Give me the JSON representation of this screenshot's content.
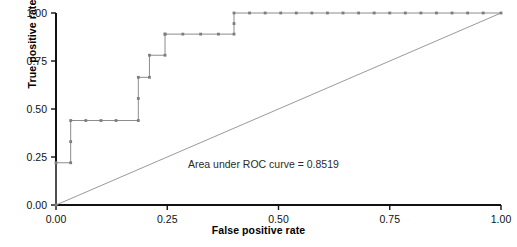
{
  "chart_data": {
    "type": "line",
    "title": "",
    "xlabel": "False positive rate",
    "ylabel": "True positive rate",
    "xlim": [
      0.0,
      1.0
    ],
    "ylim": [
      0.0,
      1.0
    ],
    "xticks": [
      "0.00",
      "0.25",
      "0.50",
      "0.75",
      "1.00"
    ],
    "yticks": [
      "0.00",
      "0.25",
      "0.50",
      "0.75",
      "1.00"
    ],
    "xtick_values": [
      0.0,
      0.25,
      0.5,
      0.75,
      1.0
    ],
    "ytick_values": [
      0.0,
      0.25,
      0.5,
      0.75,
      1.0
    ],
    "grid": false,
    "legend": "none",
    "annotation": "Area under ROC curve = 0.8519",
    "auc": 0.8519,
    "series": [
      {
        "name": "ROC curve",
        "style": "step",
        "color": "#8c8c8c",
        "marker": "dot",
        "x": [
          0.0,
          0.0,
          0.033,
          0.033,
          0.033,
          0.067,
          0.101,
          0.135,
          0.185,
          0.185,
          0.185,
          0.21,
          0.21,
          0.245,
          0.245,
          0.245,
          0.285,
          0.325,
          0.365,
          0.4,
          0.4,
          0.4,
          0.435,
          0.47,
          0.505,
          0.54,
          0.575,
          0.61,
          0.645,
          0.68,
          0.715,
          0.75,
          0.785,
          0.82,
          0.855,
          0.89,
          0.925,
          0.96,
          1.0
        ],
        "y": [
          0.0,
          0.22,
          0.22,
          0.33,
          0.44,
          0.44,
          0.44,
          0.44,
          0.44,
          0.555,
          0.665,
          0.665,
          0.78,
          0.78,
          0.89,
          0.89,
          0.89,
          0.89,
          0.89,
          0.89,
          0.945,
          1.0,
          1.0,
          1.0,
          1.0,
          1.0,
          1.0,
          1.0,
          1.0,
          1.0,
          1.0,
          1.0,
          1.0,
          1.0,
          1.0,
          1.0,
          1.0,
          1.0,
          1.0
        ]
      },
      {
        "name": "Reference diagonal",
        "style": "line",
        "color": "#9a9a9a",
        "marker": "none",
        "x": [
          0.0,
          1.0
        ],
        "y": [
          0.0,
          1.0
        ]
      }
    ]
  }
}
